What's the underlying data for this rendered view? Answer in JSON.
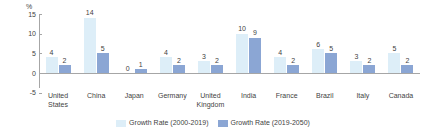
{
  "chart_data": {
    "type": "bar",
    "title": "",
    "subtitle": "",
    "xlabel": "",
    "ylabel": "%",
    "ylim": [
      -5,
      15
    ],
    "yticks": [
      15,
      10,
      5,
      0,
      -5
    ],
    "grid": false,
    "legend_position": "bottom-center",
    "categories": [
      "United States",
      "China",
      "Japan",
      "Germany",
      "United Kingdom",
      "India",
      "France",
      "Brazil",
      "Italy",
      "Canada"
    ],
    "category_lines": [
      "United\nStates",
      "China",
      "Japan",
      "Germany",
      "United\nKingdom",
      "India",
      "France",
      "Brazil",
      "Italy",
      "Canada"
    ],
    "series": [
      {
        "name": "Growth Rate (2000-2019)",
        "color": "#ddeef8",
        "values": [
          4,
          14,
          0,
          4,
          3,
          10,
          4,
          6,
          3,
          5
        ]
      },
      {
        "name": "Growth Rate (2019-2050)",
        "color": "#8ba6d4",
        "values": [
          2,
          5,
          1,
          2,
          2,
          9,
          2,
          5,
          2,
          2
        ]
      }
    ]
  },
  "axis": {
    "unit_label": "%",
    "tick_labels": [
      "15",
      "10",
      "5",
      "0",
      "-5"
    ]
  },
  "legend": {
    "items": [
      {
        "label": "Growth Rate (2000-2019)",
        "color": "#ddeef8"
      },
      {
        "label": "Growth Rate (2019-2050)",
        "color": "#8ba6d4"
      }
    ]
  }
}
